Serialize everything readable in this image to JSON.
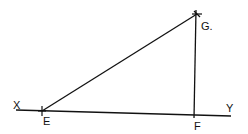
{
  "diagram": {
    "type": "geometric-construction",
    "stroke_color": "#111111",
    "background": "#ffffff",
    "points": {
      "E": {
        "label": "E",
        "x": 42,
        "y": 111
      },
      "F": {
        "label": "F",
        "x": 194,
        "y": 115
      },
      "G": {
        "label": "G.",
        "x": 197,
        "y": 14
      }
    },
    "line_ends": {
      "X": {
        "label": "X",
        "x": 16,
        "y": 110
      },
      "Y": {
        "label": "Y",
        "x": 231,
        "y": 116
      }
    },
    "segments": [
      {
        "name": "line-XY",
        "from": "X",
        "to": "Y"
      },
      {
        "name": "segment-EG",
        "from": "E",
        "to": "G"
      },
      {
        "name": "segment-FG",
        "from": "F",
        "to": "G"
      }
    ]
  }
}
